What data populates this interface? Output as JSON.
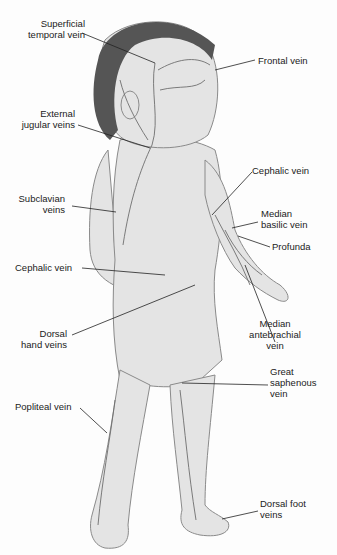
{
  "diagram": {
    "colors": {
      "skin": "#e4e4e4",
      "outline": "#8a8a8a",
      "hair": "#555555",
      "vein": "#6e6e6e",
      "leader": "#222222",
      "text": "#222222"
    },
    "labels": [
      {
        "id": "superficial-temporal-vein",
        "line1": "Superficial",
        "line2": "temporal vein"
      },
      {
        "id": "frontal-vein",
        "line1": "Frontal vein",
        "line2": ""
      },
      {
        "id": "external-jugular-veins",
        "line1": "External",
        "line2": "jugular veins"
      },
      {
        "id": "cephalic-vein-right",
        "line1": "Cephalic vein",
        "line2": ""
      },
      {
        "id": "subclavian-veins",
        "line1": "Subclavian",
        "line2": "veins"
      },
      {
        "id": "median-basilic-vein",
        "line1": "Median",
        "line2": "basilic vein"
      },
      {
        "id": "profunda",
        "line1": "Profunda",
        "line2": ""
      },
      {
        "id": "cephalic-vein-left",
        "line1": "Cephalic vein",
        "line2": ""
      },
      {
        "id": "dorsal-hand-veins",
        "line1": "Dorsal",
        "line2": "hand veins"
      },
      {
        "id": "median-antebrachial-vein",
        "line1": "Median",
        "line2": "antebrachial",
        "line3": "vein"
      },
      {
        "id": "great-saphenous-vein",
        "line1": "Great",
        "line2": "saphenous",
        "line3": "vein"
      },
      {
        "id": "popliteal-vein",
        "line1": "Popliteal vein",
        "line2": ""
      },
      {
        "id": "dorsal-foot-veins",
        "line1": "Dorsal foot",
        "line2": "veins"
      }
    ]
  }
}
